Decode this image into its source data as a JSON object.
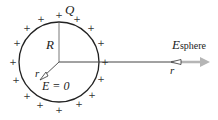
{
  "labels": {
    "charge": "Q",
    "radius": "R",
    "r_vec": "r",
    "e_inside": "E = 0",
    "e_field": "E",
    "e_field_sub": "sphere",
    "r_vec_outside": "r"
  },
  "colors": {
    "circle": "#222222",
    "field_arrow": "#b5b5b5",
    "text": "#222222"
  }
}
